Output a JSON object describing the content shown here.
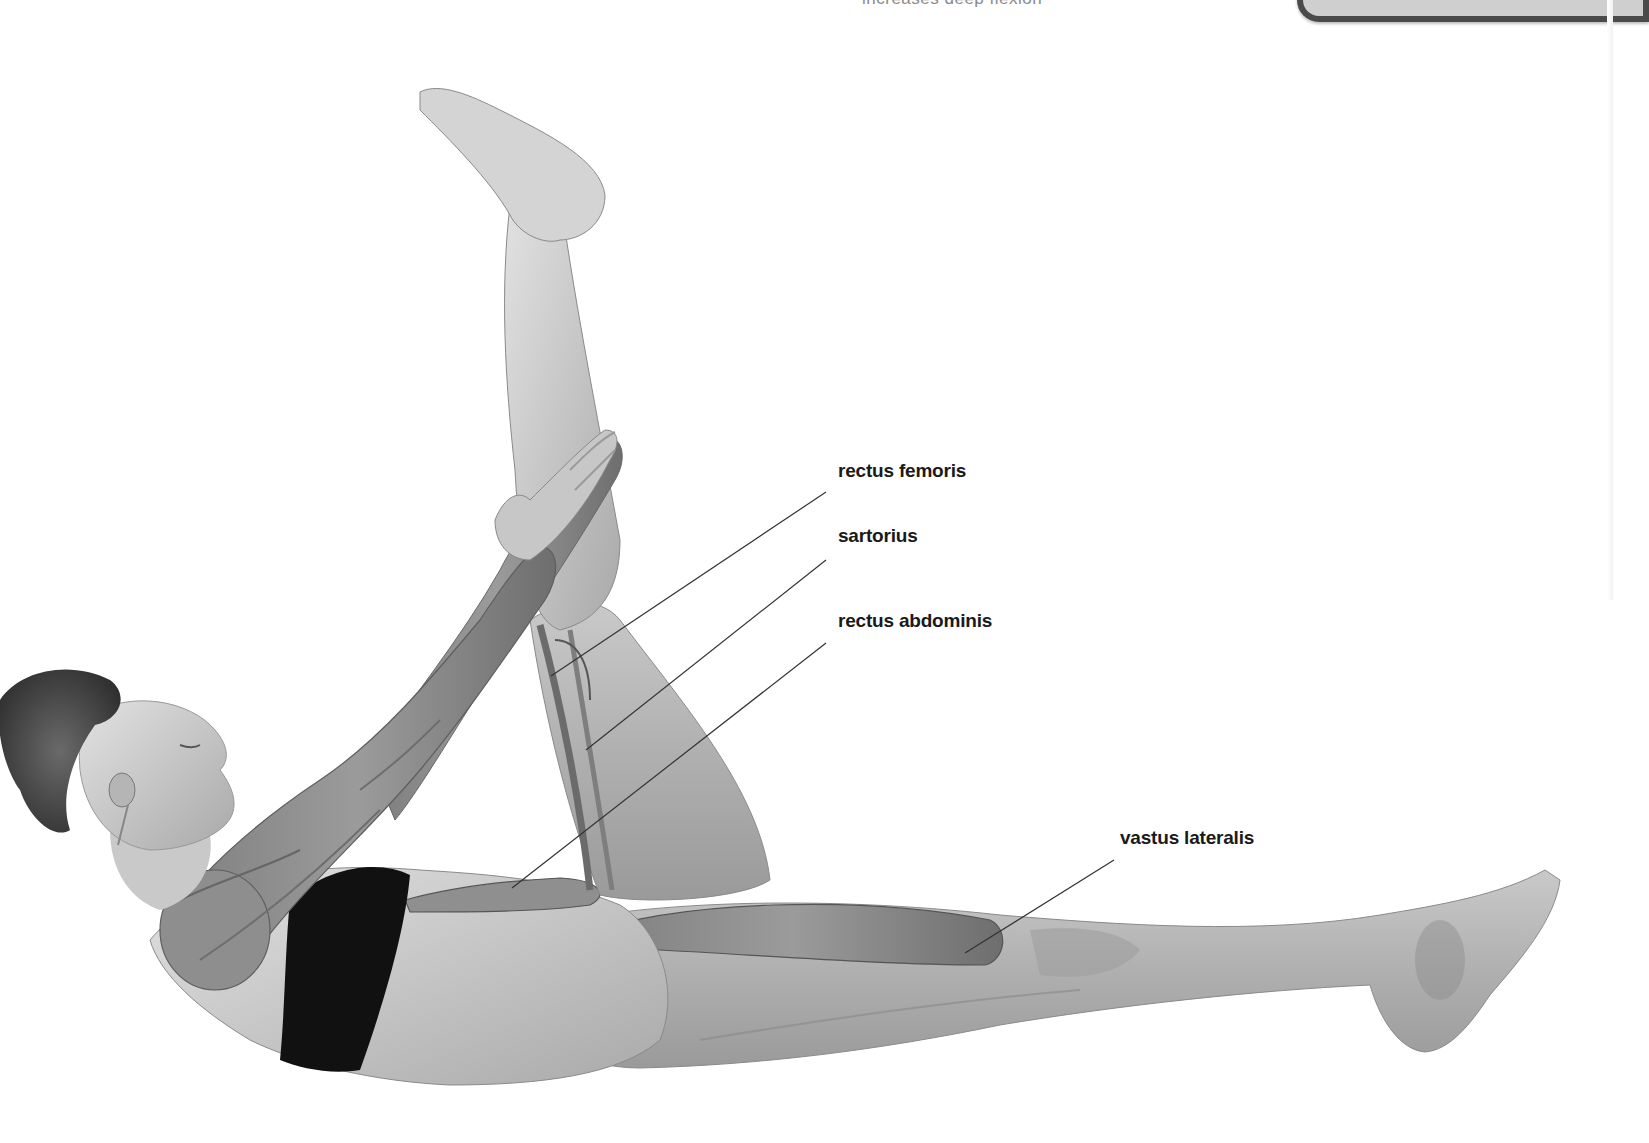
{
  "page": {
    "background": "#ffffff",
    "top_caption_partial": "increases deep flexion",
    "top_box": {
      "fill": "#cfcfcf",
      "border": "#4a4a4a"
    }
  },
  "illustration": {
    "subject": "woman lying supine, raising right leg with both hands holding shin, muscle overlay on arms, torso, and legs",
    "palette": {
      "skin_light": "#d9d9d9",
      "skin_mid": "#b3b3b3",
      "muscle": "#8c8c8c",
      "muscle_dark": "#5e5e5e",
      "garment": "#111111",
      "hair": "#4d4d4d",
      "leader_line": "#333333"
    }
  },
  "labels": [
    {
      "id": "rectus-femoris",
      "text": "rectus femoris",
      "x": 838,
      "y": 470,
      "line": {
        "x1": 826,
        "y1": 492,
        "x2": 551,
        "y2": 676
      }
    },
    {
      "id": "sartorius",
      "text": "sartorius",
      "x": 838,
      "y": 535,
      "line": {
        "x1": 826,
        "y1": 560,
        "x2": 586,
        "y2": 750
      }
    },
    {
      "id": "rectus-abdominis",
      "text": "rectus abdominis",
      "x": 838,
      "y": 620,
      "line": {
        "x1": 826,
        "y1": 643,
        "x2": 512,
        "y2": 888
      }
    },
    {
      "id": "vastus-lateralis",
      "text": "vastus lateralis",
      "x": 1120,
      "y": 837,
      "line": {
        "x1": 1114,
        "y1": 860,
        "x2": 965,
        "y2": 953
      }
    }
  ]
}
